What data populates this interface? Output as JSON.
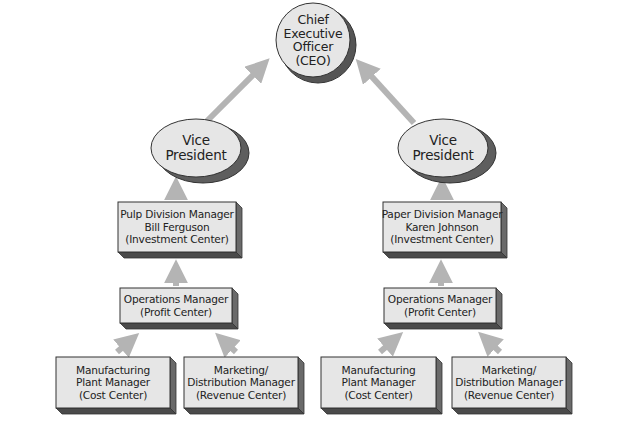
{
  "colors": {
    "background": "#ffffff",
    "node_fill": "#e6e6e6",
    "node_stroke": "#333333",
    "shadow": "#5e5e5e",
    "shadow_dark": "#444444",
    "arrow": "#b4b4b4",
    "text": "#222222"
  },
  "nodes": {
    "ceo": {
      "lines": [
        "Chief",
        "Executive",
        "Officer",
        "(CEO)"
      ]
    },
    "vp_left": {
      "lines": [
        "Vice",
        "President"
      ]
    },
    "vp_right": {
      "lines": [
        "Vice",
        "President"
      ]
    },
    "pulp_division": {
      "lines": [
        "Pulp Division Manager",
        "Bill Ferguson",
        "(Investment Center)"
      ]
    },
    "paper_division": {
      "lines": [
        "Paper Division Manager",
        "Karen Johnson",
        "(Investment Center)"
      ]
    },
    "ops_left": {
      "lines": [
        "Operations Manager",
        "(Profit Center)"
      ]
    },
    "ops_right": {
      "lines": [
        "Operations Manager",
        "(Profit Center)"
      ]
    },
    "mfg_left": {
      "lines": [
        "Manufacturing",
        "Plant Manager",
        "(Cost Center)"
      ]
    },
    "mkt_left": {
      "lines": [
        "Marketing/",
        "Distribution Manager",
        "(Revenue Center)"
      ]
    },
    "mfg_right": {
      "lines": [
        "Manufacturing",
        "Plant Manager",
        "(Cost Center)"
      ]
    },
    "mkt_right": {
      "lines": [
        "Marketing/",
        "Distribution Manager",
        "(Revenue Center)"
      ]
    }
  },
  "edges": [
    {
      "from": "vp_left",
      "to": "ceo"
    },
    {
      "from": "vp_right",
      "to": "ceo"
    },
    {
      "from": "pulp_division",
      "to": "vp_left"
    },
    {
      "from": "paper_division",
      "to": "vp_right"
    },
    {
      "from": "ops_left",
      "to": "pulp_division"
    },
    {
      "from": "ops_right",
      "to": "paper_division"
    },
    {
      "from": "mfg_left",
      "to": "ops_left"
    },
    {
      "from": "mkt_left",
      "to": "ops_left"
    },
    {
      "from": "mfg_right",
      "to": "ops_right"
    },
    {
      "from": "mkt_right",
      "to": "ops_right"
    }
  ]
}
